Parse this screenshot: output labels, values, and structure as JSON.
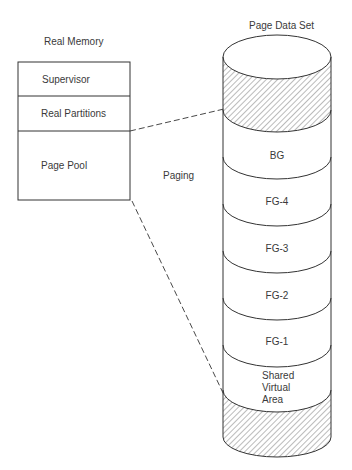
{
  "real_memory": {
    "title": "Real Memory",
    "segments": [
      {
        "label": "Supervisor"
      },
      {
        "label": "Real Partitions"
      },
      {
        "label": "Page Pool"
      }
    ]
  },
  "paging_label": "Paging",
  "page_data_set": {
    "title": "Page Data Set",
    "segments": [
      {
        "label": "BG"
      },
      {
        "label": "FG-4"
      },
      {
        "label": "FG-3"
      },
      {
        "label": "FG-2"
      },
      {
        "label": "FG-1"
      },
      {
        "label_lines": [
          "Shared",
          "Virtual",
          "Area"
        ]
      }
    ]
  },
  "colors": {
    "line": "#333333",
    "hatch": "#555555",
    "text": "#3a3a3a"
  }
}
